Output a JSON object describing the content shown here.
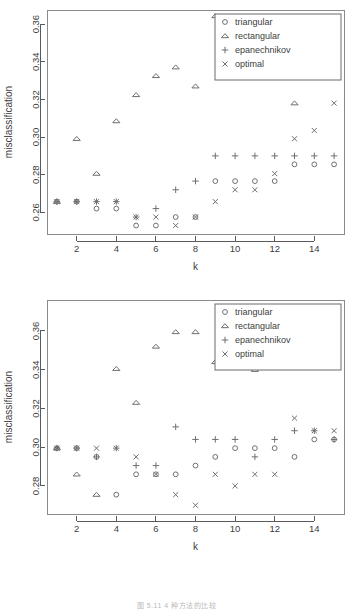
{
  "figure": {
    "caption": "图 5.11 4 种方法的比较",
    "panel_count": 2
  },
  "legend": {
    "entries": [
      {
        "label": "triangular",
        "symbol": "circle"
      },
      {
        "label": "rectangular",
        "symbol": "triangle"
      },
      {
        "label": "epanechnikov",
        "symbol": "plus"
      },
      {
        "label": "optimal",
        "symbol": "cross"
      }
    ]
  },
  "chart_data": [
    {
      "type": "scatter",
      "id": "top-panel",
      "title": "",
      "xlabel": "k",
      "ylabel": "misclassification",
      "x": [
        1,
        2,
        3,
        4,
        5,
        6,
        7,
        8,
        9,
        10,
        11,
        12,
        13,
        14,
        15
      ],
      "xlim": [
        0.5,
        15.5
      ],
      "ylim": [
        0.2485,
        0.3675
      ],
      "xticks": [
        2,
        4,
        6,
        8,
        10,
        12,
        14
      ],
      "yticks": [
        0.26,
        0.28,
        0.3,
        0.32,
        0.34,
        0.36
      ],
      "ytick_labels": [
        "0.26",
        "0.28",
        "0.30",
        "0.32",
        "0.34",
        "0.36"
      ],
      "xtick_labels": [
        "2",
        "4",
        "6",
        "8",
        "10",
        "12",
        "14"
      ],
      "grid": false,
      "legend_position": "top-right",
      "series": [
        {
          "name": "triangular",
          "symbol": "circle",
          "values": [
            0.2657,
            0.2657,
            0.262,
            0.262,
            0.253,
            0.253,
            0.2575,
            0.2575,
            0.2766,
            0.2766,
            0.2766,
            0.2766,
            0.2855,
            0.2855,
            0.2855
          ]
        },
        {
          "name": "rectangular",
          "symbol": "triangle",
          "values": [
            0.2657,
            0.2991,
            0.2806,
            0.3085,
            0.3224,
            0.3325,
            0.3371,
            0.327,
            0.3643,
            0.3456,
            0.3325,
            0.3325,
            0.318,
            0.3325,
            0.3325
          ]
        },
        {
          "name": "epanechnikov",
          "symbol": "plus",
          "values": [
            0.2657,
            0.2657,
            0.2657,
            0.2657,
            0.2575,
            0.262,
            0.272,
            0.2766,
            0.29,
            0.29,
            0.29,
            0.29,
            0.29,
            0.29,
            0.29
          ]
        },
        {
          "name": "optimal",
          "symbol": "cross",
          "values": [
            0.2657,
            0.2657,
            0.2657,
            0.2657,
            0.2575,
            0.2575,
            0.253,
            0.2575,
            0.2657,
            0.272,
            0.272,
            0.2806,
            0.2991,
            0.3035,
            0.318
          ]
        }
      ]
    },
    {
      "type": "scatter",
      "id": "bottom-panel",
      "title": "",
      "xlabel": "k",
      "ylabel": "misclassification",
      "x": [
        1,
        2,
        3,
        4,
        5,
        6,
        7,
        8,
        9,
        10,
        11,
        12,
        13,
        14,
        15
      ],
      "xlim": [
        0.5,
        15.5
      ],
      "ylim": [
        0.2655,
        0.376
      ],
      "xticks": [
        2,
        4,
        6,
        8,
        10,
        12,
        14
      ],
      "yticks": [
        0.28,
        0.3,
        0.32,
        0.34,
        0.36
      ],
      "ytick_labels": [
        "0.28",
        "0.30",
        "0.32",
        "0.34",
        "0.36"
      ],
      "xtick_labels": [
        "2",
        "4",
        "6",
        "8",
        "10",
        "12",
        "14"
      ],
      "grid": false,
      "legend_position": "top-right",
      "series": [
        {
          "name": "triangular",
          "symbol": "circle",
          "values": [
            0.2995,
            0.2995,
            0.295,
            0.2755,
            0.286,
            0.286,
            0.286,
            0.2905,
            0.295,
            0.2995,
            0.2995,
            0.2995,
            0.295,
            0.304,
            0.304
          ]
        },
        {
          "name": "rectangular",
          "symbol": "triangle",
          "values": [
            0.2995,
            0.286,
            0.2755,
            0.3405,
            0.323,
            0.352,
            0.3595,
            0.3595,
            0.344,
            0.344,
            0.34,
            0.37,
            0.3595,
            0.344,
            0.37
          ]
        },
        {
          "name": "epanechnikov",
          "symbol": "plus",
          "values": [
            0.2995,
            0.2995,
            0.295,
            0.2995,
            0.2905,
            0.2905,
            0.3105,
            0.304,
            0.304,
            0.304,
            0.295,
            0.304,
            0.3085,
            0.3085,
            0.304
          ]
        },
        {
          "name": "optimal",
          "symbol": "cross",
          "values": [
            0.2995,
            0.2995,
            0.2995,
            0.2995,
            0.295,
            0.286,
            0.2755,
            0.27,
            0.286,
            0.28,
            0.286,
            0.286,
            0.315,
            0.3085,
            0.3085
          ]
        }
      ]
    }
  ]
}
